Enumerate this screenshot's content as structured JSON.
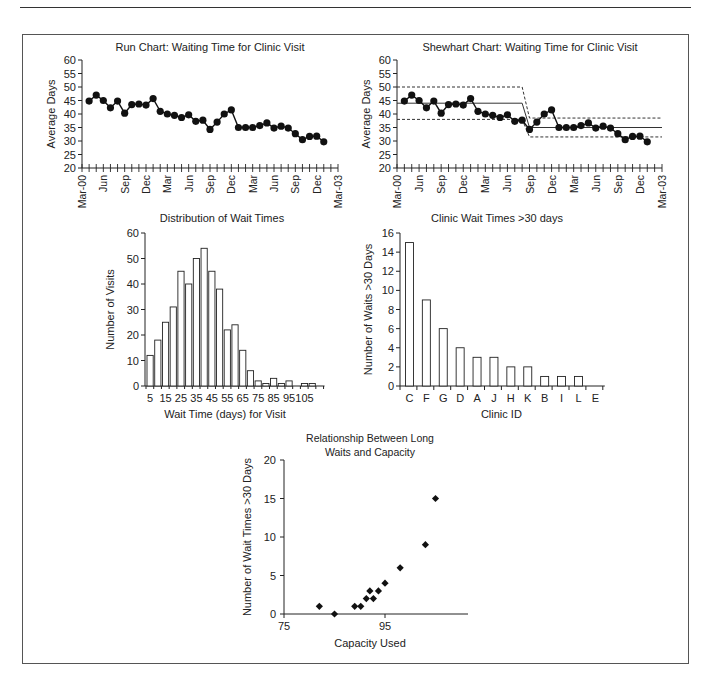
{
  "chart_data": [
    {
      "id": "run",
      "type": "line",
      "title": "Run Chart: Waiting Time for Clinic Visit",
      "xlabel": "",
      "ylabel": "Average Days",
      "ylim": [
        20,
        60
      ],
      "yticks": [
        20,
        25,
        30,
        35,
        40,
        45,
        50,
        55,
        60
      ],
      "xtick_labels": [
        "Mar-00",
        "Jun",
        "Sep",
        "Dec",
        "Mar",
        "Jun",
        "Sep",
        "Dec",
        "Mar",
        "Jun",
        "Sep",
        "Dec",
        "Mar-03"
      ],
      "x_months_total": 36,
      "x_start_month_index": 1,
      "grid": false,
      "values": [
        44.8,
        47,
        45,
        42.3,
        44.8,
        40.3,
        43.5,
        43.7,
        43.3,
        45.7,
        41,
        40,
        39.5,
        38.7,
        39.7,
        37.3,
        37.7,
        34.3,
        37,
        40,
        41.5,
        35,
        35,
        35,
        35.7,
        36.7,
        34.8,
        35.5,
        34.8,
        32.7,
        30.5,
        31.7,
        31.8,
        29.7
      ]
    },
    {
      "id": "shewhart",
      "type": "line",
      "title": "Shewhart Chart: Waiting Time for Clinic Visit",
      "xlabel": "",
      "ylabel": "Average Days",
      "ylim": [
        20,
        60
      ],
      "yticks": [
        20,
        25,
        30,
        35,
        40,
        45,
        50,
        55,
        60
      ],
      "xtick_labels": [
        "Mar-00",
        "Jun",
        "Sep",
        "Dec",
        "Mar",
        "Jun",
        "Sep",
        "Dec",
        "Mar",
        "Jun",
        "Sep",
        "Dec",
        "Mar-03"
      ],
      "x_months_total": 36,
      "x_start_month_index": 1,
      "grid": false,
      "values": [
        44.8,
        47,
        45,
        42.3,
        44.8,
        40.3,
        43.5,
        43.7,
        43.3,
        45.7,
        41,
        40,
        39.5,
        38.7,
        39.7,
        37.3,
        37.7,
        34.3,
        37,
        40,
        41.5,
        35,
        35,
        35,
        35.7,
        36.7,
        34.8,
        35.5,
        34.8,
        32.7,
        30.5,
        31.7,
        31.8,
        29.7
      ],
      "control_limits": [
        {
          "phase": 1,
          "from_month": 0,
          "to_month": 17,
          "center": 44,
          "ucl": 50,
          "lcl": 38
        },
        {
          "phase": 2,
          "from_month": 18,
          "to_month": 36,
          "center": 35,
          "ucl": 38.5,
          "lcl": 31.5
        }
      ]
    },
    {
      "id": "histogram",
      "type": "bar",
      "title": "Distribution of Wait Times",
      "xlabel": "Wait Time (days) for Visit",
      "ylabel": "Number of Visits",
      "ylim": [
        0,
        60
      ],
      "yticks": [
        0,
        10,
        20,
        30,
        40,
        50,
        60
      ],
      "categories": [
        5,
        10,
        15,
        20,
        25,
        30,
        35,
        40,
        45,
        50,
        55,
        60,
        65,
        70,
        75,
        80,
        85,
        90,
        95,
        100,
        105,
        110,
        115
      ],
      "xtick_labels": [
        "5",
        "15",
        "25",
        "35",
        "45",
        "55",
        "65",
        "75",
        "85",
        "95",
        "105"
      ],
      "values": [
        12,
        18,
        25,
        31,
        45,
        40,
        50,
        54,
        45,
        38,
        22,
        24,
        14,
        6,
        2,
        1,
        3,
        1,
        2,
        0,
        1,
        1,
        0
      ],
      "grid": false
    },
    {
      "id": "pareto",
      "type": "bar",
      "title": "Clinic Wait Times >30 days",
      "xlabel": "Clinic ID",
      "ylabel": "Number of Waits >30 Days",
      "ylim": [
        0,
        16
      ],
      "yticks": [
        0,
        2,
        4,
        6,
        8,
        10,
        12,
        14,
        16
      ],
      "categories": [
        "C",
        "F",
        "G",
        "D",
        "A",
        "J",
        "H",
        "K",
        "B",
        "I",
        "L",
        "E"
      ],
      "values": [
        15,
        9,
        6,
        4,
        3,
        3,
        2,
        2,
        1,
        1,
        1,
        0
      ],
      "grid": false
    },
    {
      "id": "scatter",
      "type": "scatter",
      "title": "Relationship Between Long Waits and Capacity",
      "title_lines": [
        "Relationship Between Long",
        "Waits and Capacity"
      ],
      "xlabel": "Capacity Used",
      "ylabel": "Number of Wait Times >30 Days",
      "xlim": [
        75,
        107
      ],
      "ylim": [
        0,
        20
      ],
      "xticks": [
        75,
        95
      ],
      "yticks": [
        0,
        5,
        10,
        15,
        20
      ],
      "points": [
        {
          "x": 82,
          "y": 1
        },
        {
          "x": 85,
          "y": 0
        },
        {
          "x": 89,
          "y": 1
        },
        {
          "x": 90.2,
          "y": 1
        },
        {
          "x": 91.3,
          "y": 2
        },
        {
          "x": 92,
          "y": 3
        },
        {
          "x": 92.7,
          "y": 2
        },
        {
          "x": 93.7,
          "y": 3
        },
        {
          "x": 95,
          "y": 4
        },
        {
          "x": 98,
          "y": 6
        },
        {
          "x": 103,
          "y": 9
        },
        {
          "x": 105,
          "y": 15
        }
      ],
      "grid": false
    }
  ]
}
